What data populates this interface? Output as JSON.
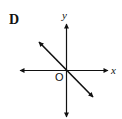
{
  "figure": {
    "option_label": "D",
    "axes": {
      "x_label": "x",
      "y_label": "y",
      "origin_label": "O"
    },
    "line": {
      "description": "line through origin with negative slope",
      "slope_sign": "negative",
      "passes_through_origin": true
    },
    "colors": {
      "ink": "#111111",
      "background": "#ffffff"
    }
  }
}
